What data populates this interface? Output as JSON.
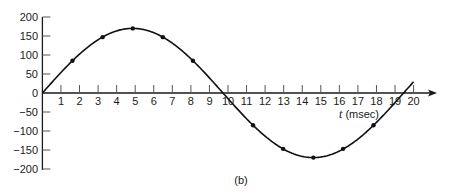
{
  "figure": {
    "caption": "(b)",
    "colors": {
      "line": "#111111",
      "axis": "#1a1a1a",
      "background": "#ffffff"
    }
  },
  "chart_data": {
    "type": "line",
    "title": "",
    "xlabel": "t (msec)",
    "xlabel_var": "t",
    "xlabel_unit": "(msec)",
    "ylabel": "",
    "xlim": [
      0,
      20
    ],
    "ylim": [
      -200,
      200
    ],
    "grid": false,
    "legend": "none",
    "x_ticks": [
      "1",
      "2",
      "3",
      "4",
      "5",
      "6",
      "7",
      "8",
      "9",
      "10",
      "11",
      "12",
      "13",
      "14",
      "15",
      "16",
      "17",
      "18",
      "19",
      "20"
    ],
    "y_ticks": [
      {
        "value": 200,
        "label": "200"
      },
      {
        "value": 150,
        "label": "150"
      },
      {
        "value": 100,
        "label": "100"
      },
      {
        "value": 50,
        "label": "50"
      },
      {
        "value": 0,
        "label": "0"
      },
      {
        "value": -50,
        "label": "−50"
      },
      {
        "value": -100,
        "label": "−100"
      },
      {
        "value": -150,
        "label": "−150"
      },
      {
        "value": -200,
        "label": "−200"
      }
    ],
    "curve": {
      "form": "sinusoid",
      "amplitude": 170,
      "period_ms": 19.46,
      "t_start": 0,
      "t_end": 20
    },
    "series": [
      {
        "name": "v(t)",
        "marked_points": true,
        "x": [
          1.62,
          3.24,
          4.87,
          6.49,
          8.11,
          11.35,
          12.97,
          14.6,
          16.2,
          17.84
        ],
        "values": [
          85,
          147,
          170,
          147,
          85,
          -85,
          -147,
          -170,
          -147,
          -85
        ]
      }
    ],
    "zero_crossings_ms": [
      0,
      9.73,
      19.46
    ],
    "annotations": [
      {
        "text": "(b)",
        "position": "below plot"
      }
    ]
  }
}
